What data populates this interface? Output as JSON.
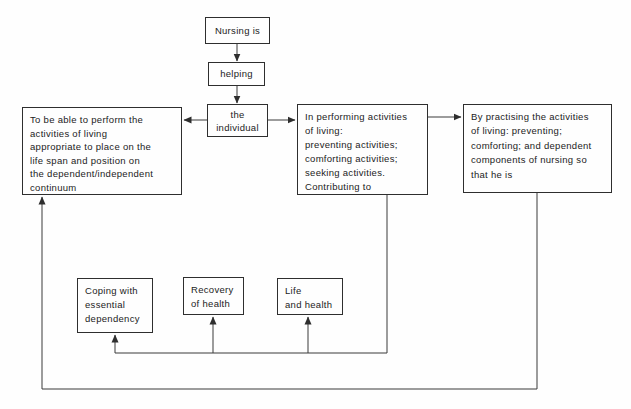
{
  "colors": {
    "background": "#fefefe",
    "line": "#3a3a3a",
    "box_border": "#2e2e2e",
    "text": "#1c1c1c"
  },
  "nodes": {
    "nursing_is": {
      "label": "Nursing is"
    },
    "helping": {
      "label": "helping"
    },
    "individual": {
      "label": "the\nindividual"
    },
    "perform": {
      "label": "To be able to perform the\nactivities of living\nappropriate to place on the\nlife span and position on\nthe dependent/independent\ncontinuum"
    },
    "performing": {
      "label": "In performing activities\nof living:\npreventing activities;\ncomforting activities;\nseeking activities.\nContributing to"
    },
    "practising": {
      "label": "By practising the activities\nof living: preventing;\ncomforting; and dependent\ncomponents of nursing so\nthat he is"
    },
    "coping": {
      "label": "Coping with\nessential\ndependency"
    },
    "recovery": {
      "label": "Recovery\nof health"
    },
    "life": {
      "label": "Life\nand health"
    }
  },
  "edges": [
    {
      "from": "nursing_is",
      "to": "helping"
    },
    {
      "from": "helping",
      "to": "individual"
    },
    {
      "from": "individual",
      "to": "perform"
    },
    {
      "from": "individual",
      "to": "performing"
    },
    {
      "from": "performing",
      "to": "practising"
    },
    {
      "from": "performing",
      "to": "coping"
    },
    {
      "from": "performing",
      "to": "recovery"
    },
    {
      "from": "performing",
      "to": "life"
    },
    {
      "from": "practising",
      "to": "perform"
    }
  ]
}
